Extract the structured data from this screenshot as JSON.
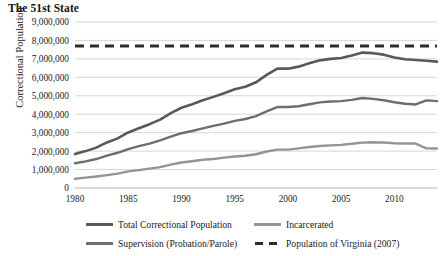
{
  "chart_data": {
    "type": "line",
    "title": "The 51st State",
    "xlabel": "",
    "ylabel": "Correctional Population",
    "xlim": [
      1980,
      2014
    ],
    "ylim": [
      0,
      9000000
    ],
    "ytick_step": 1000000,
    "grid": true,
    "legend_position": "bottom",
    "xticks": [
      1980,
      1985,
      1990,
      1995,
      2000,
      2005,
      2010
    ],
    "xtick_labels": [
      "1980",
      "1985",
      "1990",
      "1995",
      "2000",
      "2005",
      "2010"
    ],
    "yticks": [
      0,
      1000000,
      2000000,
      3000000,
      4000000,
      5000000,
      6000000,
      7000000,
      8000000,
      9000000
    ],
    "ytick_labels": [
      "0",
      "1,000,000",
      "2,000,000",
      "3,000,000",
      "4,000,000",
      "5,000,000",
      "6,000,000",
      "7,000,000",
      "8,000,000",
      "9,000,000"
    ],
    "x": [
      1980,
      1981,
      1982,
      1983,
      1984,
      1985,
      1986,
      1987,
      1988,
      1989,
      1990,
      1991,
      1992,
      1993,
      1994,
      1995,
      1996,
      1997,
      1998,
      1999,
      2000,
      2001,
      2002,
      2003,
      2004,
      2005,
      2006,
      2007,
      2008,
      2009,
      2010,
      2011,
      2012,
      2013,
      2014
    ],
    "series": [
      {
        "name": "Total Correctional Population",
        "color": "#595959",
        "style": "solid",
        "width": 2.6,
        "values": [
          1840000,
          2000000,
          2190000,
          2470000,
          2690000,
          3010000,
          3240000,
          3460000,
          3710000,
          4060000,
          4350000,
          4540000,
          4760000,
          4940000,
          5140000,
          5350000,
          5490000,
          5730000,
          6130000,
          6470000,
          6470000,
          6580000,
          6760000,
          6920000,
          7000000,
          7050000,
          7180000,
          7340000,
          7310000,
          7230000,
          7080000,
          6980000,
          6940000,
          6900000,
          6850000
        ]
      },
      {
        "name": "Supervision (Probation/Parole)",
        "color": "#6e6e6e",
        "style": "solid",
        "width": 2.4,
        "values": [
          1340000,
          1440000,
          1570000,
          1760000,
          1910000,
          2110000,
          2270000,
          2410000,
          2580000,
          2790000,
          2970000,
          3090000,
          3230000,
          3370000,
          3490000,
          3640000,
          3740000,
          3900000,
          4150000,
          4390000,
          4390000,
          4430000,
          4540000,
          4640000,
          4690000,
          4710000,
          4780000,
          4880000,
          4830000,
          4760000,
          4650000,
          4570000,
          4530000,
          4750000,
          4710000
        ]
      },
      {
        "name": "Incarcerated",
        "color": "#949494",
        "style": "solid",
        "width": 2.4,
        "values": [
          500000,
          560000,
          620000,
          700000,
          780000,
          900000,
          970000,
          1050000,
          1130000,
          1270000,
          1380000,
          1450000,
          1530000,
          1570000,
          1650000,
          1710000,
          1750000,
          1830000,
          1980000,
          2080000,
          2080000,
          2150000,
          2220000,
          2280000,
          2310000,
          2340000,
          2400000,
          2460000,
          2480000,
          2470000,
          2430000,
          2410000,
          2410000,
          2150000,
          2140000
        ]
      }
    ],
    "reference_line": {
      "name": "Population of Virginia (2007)",
      "value": 7700000,
      "color": "#2e2e2e",
      "style": "dashed",
      "width": 3.0
    },
    "legend": [
      {
        "label": "Total Correctional Population",
        "color": "#595959",
        "style": "solid"
      },
      {
        "label": "Incarcerated",
        "color": "#949494",
        "style": "solid"
      },
      {
        "label": "Supervision (Probation/Parole)",
        "color": "#6e6e6e",
        "style": "solid"
      },
      {
        "label": "Population of Virginia (2007)",
        "color": "#2e2e2e",
        "style": "dashed"
      }
    ]
  }
}
